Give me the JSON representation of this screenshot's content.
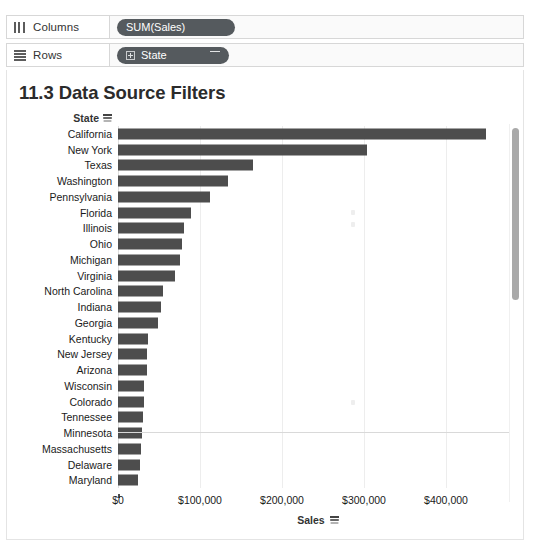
{
  "shelves": [
    {
      "id": "columns",
      "icon": "columns-icon",
      "label": "Columns",
      "pill": {
        "text": "SUM(Sales)",
        "has_plus": false,
        "has_sort": false
      }
    },
    {
      "id": "rows",
      "icon": "rows-icon",
      "label": "Rows",
      "pill": {
        "text": "State",
        "has_plus": true,
        "has_sort": true
      }
    }
  ],
  "viz": {
    "title": "11.3 Data Source Filters",
    "row_header": "State",
    "row_header_icon": "sort-descending-icon",
    "axis_title": "Sales",
    "axis_title_icon": "sort-descending-icon",
    "bar_color": "#4d4d4d",
    "scrollbar": {
      "name": "vertical-scrollbar",
      "thumb_color": "#a9a9a9"
    }
  },
  "chart_data": {
    "type": "bar",
    "orientation": "horizontal",
    "title": "11.3 Data Source Filters",
    "xlabel": "Sales",
    "ylabel": "State",
    "xlim": [
      0,
      450000
    ],
    "grid": true,
    "legend": false,
    "tick_labels": [
      "$0",
      "$100,000",
      "$200,000",
      "$300,000",
      "$400,000"
    ],
    "tick_values": [
      0,
      100000,
      200000,
      300000,
      400000
    ],
    "categories": [
      "California",
      "New York",
      "Texas",
      "Washington",
      "Pennsylvania",
      "Florida",
      "Illinois",
      "Ohio",
      "Michigan",
      "Virginia",
      "North Carolina",
      "Indiana",
      "Georgia",
      "Kentucky",
      "New Jersey",
      "Arizona",
      "Wisconsin",
      "Colorado",
      "Tennessee",
      "Minnesota",
      "Massachusetts",
      "Delaware",
      "Maryland",
      ""
    ],
    "values": [
      449000,
      304000,
      165000,
      134000,
      112000,
      89000,
      80000,
      78000,
      76000,
      70000,
      55000,
      53000,
      49000,
      36000,
      35000,
      35000,
      32000,
      32000,
      30000,
      29000,
      28000,
      27000,
      24000,
      3000
    ]
  }
}
